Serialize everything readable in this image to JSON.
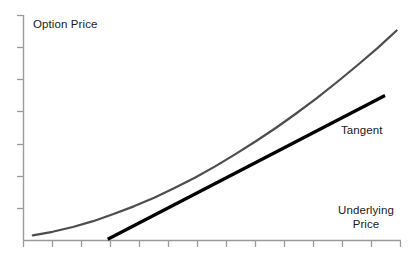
{
  "chart_data": {
    "type": "line",
    "title": "",
    "subtitle": "",
    "xlabel": "Underlying Price",
    "xlabel_lines": [
      "Underlying",
      "Price"
    ],
    "ylabel": "Option Price",
    "grid": false,
    "legend_position": "inline-annotation",
    "xlim": [
      0,
      13
    ],
    "ylim": [
      0,
      7
    ],
    "x_tick_count": 14,
    "y_tick_count": 7,
    "x_tick_labels": [],
    "y_tick_labels": [],
    "annotations": [
      {
        "name": "tangent-annotation",
        "text": "Tangent",
        "x": 11.3,
        "y": 2.45
      }
    ],
    "series": [
      {
        "name": "Option Price Curve",
        "type": "line",
        "color": "#4d4d4d",
        "width": 2.2,
        "x": [
          0.32,
          1.0,
          1.7,
          2.4,
          3.1,
          3.8,
          4.5,
          5.2,
          5.9,
          6.6,
          7.3,
          8.0,
          8.7,
          9.4,
          10.1,
          10.8,
          11.5,
          12.2,
          12.85
        ],
        "y": [
          0.16,
          0.27,
          0.42,
          0.6,
          0.82,
          1.06,
          1.33,
          1.63,
          1.95,
          2.3,
          2.68,
          3.08,
          3.5,
          3.95,
          4.42,
          4.92,
          5.44,
          5.98,
          6.52
        ]
      },
      {
        "name": "Tangent",
        "type": "line",
        "color": "#000000",
        "width": 3.2,
        "x": [
          2.9,
          12.45
        ],
        "y": [
          0.04,
          4.5
        ]
      }
    ],
    "tangency_point": {
      "x": 6.3,
      "y": 2.15
    }
  },
  "labels": {
    "y_axis_title": "Option Price",
    "x_axis_title_line1": "Underlying",
    "x_axis_title_line2": "Price",
    "tangent": "Tangent"
  },
  "colors": {
    "background": "#ffffff",
    "axis": "#9a9a9a",
    "tick": "#9a9a9a",
    "curve": "#4d4d4d",
    "tangent": "#000000",
    "text": "#1a1a1a"
  }
}
